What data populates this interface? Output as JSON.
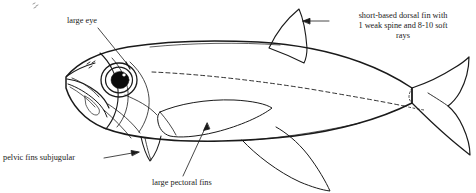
{
  "figure": {
    "kind": "fish-anatomy-line-drawing",
    "background_color": "#ffffff",
    "ink_color": "#1a1a1a",
    "width": 476,
    "height": 193
  },
  "annotations": [
    {
      "id": "large-eye",
      "text": "large eye",
      "points_to": "eye",
      "leader": "diagonal line from text down-right to the eye"
    },
    {
      "id": "dorsal-fin",
      "text": "short-based dorsal fin with\n1 weak spine and 8-10 soft\nrays",
      "points_to": "dorsal-fin",
      "leader": "horizontal line with left-pointing arrowhead"
    },
    {
      "id": "pelvic-fins",
      "text": "pelvic fins subjugular",
      "points_to": "pelvic-fin",
      "leader": "horizontal line with right-pointing arrowhead"
    },
    {
      "id": "pectoral-fins",
      "text": "large pectoral fins",
      "points_to": "pectoral-fin",
      "leader": "diagonal line up-right with arrowhead"
    }
  ],
  "anatomy_parts": [
    "body-outline",
    "head",
    "eye",
    "pupil",
    "snout",
    "mouth",
    "nostril",
    "operculum",
    "lateral-line",
    "dorsal-fin",
    "caudal-fin",
    "anal-fin",
    "pelvic-fin",
    "pectoral-fin"
  ]
}
